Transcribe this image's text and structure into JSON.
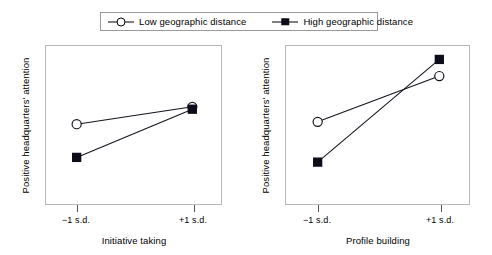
{
  "legend": {
    "items": [
      {
        "key": "open-circle",
        "label": "Low geographic distance"
      },
      {
        "key": "filled-square",
        "label": "High geographic distance"
      }
    ]
  },
  "axis": {
    "ylabel": "Positive headquarters' attention",
    "tick_low": "−1 s.d.",
    "tick_high": "+1 s.d."
  },
  "chart_data": [
    {
      "type": "line",
      "title": "",
      "xlabel": "Initiative taking",
      "ylabel": "Positive headquarters' attention",
      "categories": [
        "−1 s.d.",
        "+1 s.d."
      ],
      "xlim": [
        0,
        1
      ],
      "ylim": [
        0,
        1
      ],
      "grid": false,
      "legend_position": "top-center",
      "series": [
        {
          "name": "Low geographic distance",
          "marker": "open-circle",
          "values": [
            0.505,
            0.615
          ]
        },
        {
          "name": "High geographic distance",
          "marker": "filled-square",
          "values": [
            0.295,
            0.6
          ]
        }
      ]
    },
    {
      "type": "line",
      "title": "",
      "xlabel": "Profile building",
      "ylabel": "Positive headquarters' attention",
      "categories": [
        "−1 s.d.",
        "+1 s.d."
      ],
      "xlim": [
        0,
        1
      ],
      "ylim": [
        0,
        1
      ],
      "grid": false,
      "legend_position": "top-center",
      "series": [
        {
          "name": "Low geographic distance",
          "marker": "open-circle",
          "values": [
            0.52,
            0.81
          ]
        },
        {
          "name": "High geographic distance",
          "marker": "filled-square",
          "values": [
            0.265,
            0.915
          ]
        }
      ]
    }
  ]
}
